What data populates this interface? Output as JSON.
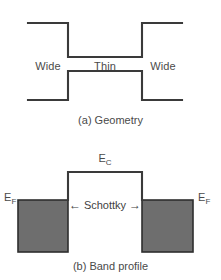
{
  "figure": {
    "background_color": "#ffffff",
    "line_color": "#3a3a3a",
    "fill_color": "#6e6e6e",
    "text_color": "#4a4a4a"
  },
  "panel_a": {
    "caption": "(a) Geometry",
    "labels": {
      "left_region": "Wide",
      "middle_region": "Thin",
      "right_region": "Wide"
    }
  },
  "panel_b": {
    "caption": "(b) Band profile",
    "labels": {
      "conduction_band": "E",
      "conduction_band_sub": "C",
      "fermi_left": "E",
      "fermi_left_sub": "F",
      "fermi_right": "E",
      "fermi_right_sub": "F",
      "barrier": "Schottky",
      "arrow_left": "←",
      "arrow_right": "→"
    }
  }
}
